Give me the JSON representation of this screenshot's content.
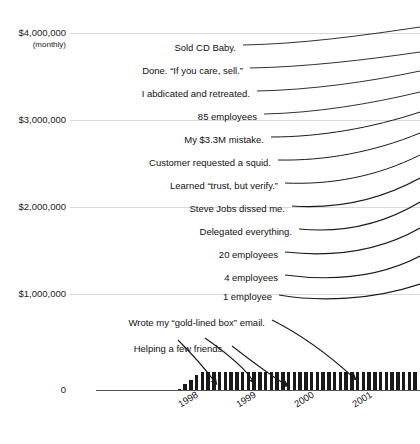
{
  "chart_data": {
    "type": "bar",
    "title": "",
    "subtitle": "",
    "xlabel": "",
    "ylabel": "",
    "ylim": [
      0,
      4000000
    ],
    "grid": true,
    "legend_position": "none",
    "y_ticks": [
      {
        "label": "$4,000,000",
        "value": 4000000,
        "sublabel": "(monthly)"
      },
      {
        "label": "$3,000,000",
        "value": 3000000,
        "sublabel": ""
      },
      {
        "label": "$2,000,000",
        "value": 2000000,
        "sublabel": ""
      },
      {
        "label": "$1,000,000",
        "value": 1000000,
        "sublabel": ""
      },
      {
        "label": "0",
        "value": 0,
        "sublabel": ""
      }
    ],
    "x_ticks": [
      "1998",
      "1999",
      "2000",
      "2001"
    ],
    "categories": [
      "1997-Q4",
      "1998-Q1",
      "1998-Q2",
      "1998-Q3",
      "1998-Q4",
      "1999-Q1",
      "1999-Q2",
      "1999-Q3",
      "1999-Q4",
      "2000-Q1",
      "2000-Q2",
      "2000-Q3",
      "2000-Q4",
      "2001-Q1",
      "2001-Q2",
      "2001-Q3",
      "2001-Q4"
    ],
    "values": [
      0,
      0,
      0,
      0,
      0,
      6000,
      9000,
      13000,
      18000,
      26000,
      38000,
      52000,
      70000,
      95000,
      125000,
      160000,
      195000
    ],
    "annotations": [
      "Sold CD Baby.",
      "Done. “If you care, sell.”",
      "I abdicated and retreated.",
      "85 employees",
      "My $3.3M mistake.",
      "Customer requested a squid.",
      "Learned “trust, but verify.”",
      "Steve Jobs dissed me.",
      "Delegated everything.",
      "20 employees",
      "4 employees",
      "1 employee",
      "Wrote my “gold-lined box” email.",
      "Helping a few friends."
    ]
  },
  "colors": {
    "bar": "#1a1a1a",
    "grid": "#d9d9d9",
    "axis": "#555555",
    "text": "#111111",
    "leader": "#1a1a1a"
  }
}
